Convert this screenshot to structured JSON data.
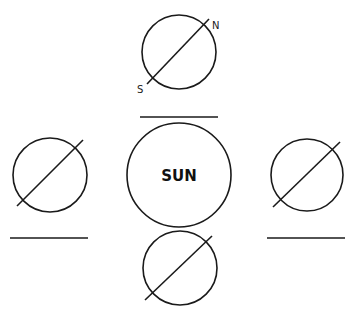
{
  "diagram": {
    "title": "",
    "sun": {
      "label": "SUN",
      "cx": 179,
      "cy": 175,
      "r": 52
    },
    "axis_labels": {
      "north": "N",
      "south": "S"
    },
    "earth_positions": [
      {
        "id": "top",
        "cx": 179,
        "cy": 52,
        "r": 37,
        "axis": [
          147,
          84,
          209,
          19
        ],
        "blank": [
          140,
          117,
          218,
          117
        ],
        "labeled": true
      },
      {
        "id": "left",
        "cx": 50,
        "cy": 175,
        "r": 37,
        "axis": [
          17,
          206,
          83,
          140
        ],
        "blank": [
          10,
          238,
          88,
          238
        ],
        "labeled": false
      },
      {
        "id": "right",
        "cx": 307,
        "cy": 175,
        "r": 36,
        "axis": [
          273,
          207,
          340,
          142
        ],
        "blank": [
          267,
          238,
          345,
          238
        ],
        "labeled": false
      },
      {
        "id": "bottom",
        "cx": 180,
        "cy": 268,
        "r": 37,
        "axis": [
          145,
          300,
          212,
          236
        ],
        "blank": null,
        "labeled": false
      }
    ],
    "colors": {
      "stroke": "#1a1a1a",
      "background": "#ffffff"
    }
  }
}
